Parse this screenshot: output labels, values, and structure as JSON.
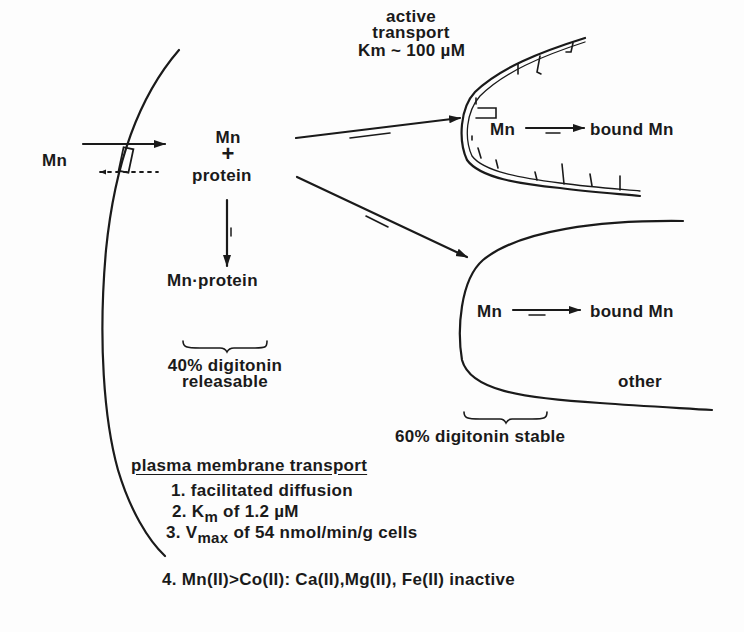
{
  "diagram": {
    "outside": {
      "species": "Mn"
    },
    "cytosol": {
      "complex_top": "Mn",
      "complex_plus": "+",
      "complex_bottom": "protein",
      "product": "Mn·protein",
      "fraction_label_line1": "40% digitonin",
      "fraction_label_line2": "releasable"
    },
    "vacuole_active": {
      "header_line1": "active",
      "header_line2": "transport",
      "header_line3": "Km ~ 100 µM",
      "reactant": "Mn",
      "product": "bound Mn"
    },
    "other_compartment": {
      "reactant": "Mn",
      "product": "bound Mn",
      "label": "other"
    },
    "stable_label": "60% digitonin stable",
    "plasma_membrane": {
      "title": "plasma membrane transport",
      "items": [
        {
          "prefix": "1. ",
          "text": "facilitated diffusion"
        },
        {
          "prefix": "2. K",
          "sub": "m",
          "text": " of 1.2 µM"
        },
        {
          "prefix": "3. V",
          "sub": "max",
          "text": " of 54 nmol/min/g cells"
        },
        {
          "prefix": "4. ",
          "text": "Mn(II)>Co(II):  Ca(II),Mg(II), Fe(II) inactive"
        }
      ]
    },
    "colors": {
      "ink": "#1a1a1a",
      "paper": "#fdfdfd"
    }
  }
}
